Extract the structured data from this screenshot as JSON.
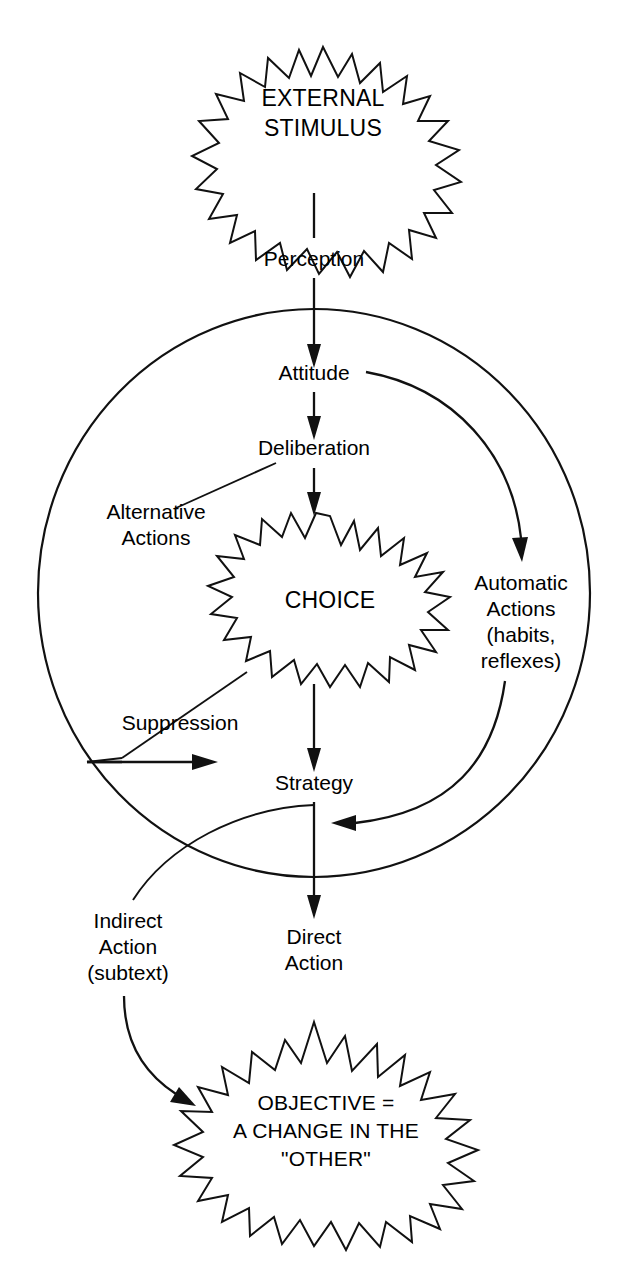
{
  "figure": {
    "kind": "flow-diagram",
    "background_color": "#ffffff",
    "ink_color": "#111111",
    "nodes": {
      "external_stimulus": {
        "shape": "starburst",
        "line1": "EXTERNAL",
        "line2": "STIMULUS"
      },
      "perception": {
        "shape": "text",
        "label": "Perception"
      },
      "attitude": {
        "shape": "text",
        "label": "Attitude"
      },
      "deliberation": {
        "shape": "text",
        "label": "Deliberation"
      },
      "alternative_actions": {
        "shape": "text",
        "line1": "Alternative",
        "line2": "Actions"
      },
      "choice": {
        "shape": "starburst",
        "label": "CHOICE"
      },
      "automatic_actions": {
        "shape": "text",
        "line1": "Automatic",
        "line2": "Actions",
        "line3": "(habits,",
        "line4": "reflexes)"
      },
      "suppression": {
        "shape": "text",
        "label": "Suppression"
      },
      "strategy": {
        "shape": "text",
        "label": "Strategy"
      },
      "indirect_action": {
        "shape": "text",
        "line1": "Indirect",
        "line2": "Action",
        "line3": "(subtext)"
      },
      "direct_action": {
        "shape": "text",
        "line1": "Direct",
        "line2": "Action"
      },
      "objective": {
        "shape": "starburst",
        "line1": "OBJECTIVE =",
        "line2": "A CHANGE IN THE",
        "line3": "\"OTHER\""
      }
    },
    "enclosure": {
      "name": "inner-world-circle",
      "shape": "circle"
    },
    "edges": [
      {
        "from": "external_stimulus",
        "to": "perception",
        "style": "straight"
      },
      {
        "from": "perception",
        "to": "attitude",
        "style": "straight-arrow"
      },
      {
        "from": "attitude",
        "to": "deliberation",
        "style": "straight-arrow"
      },
      {
        "from": "deliberation",
        "to": "choice",
        "style": "straight-arrow"
      },
      {
        "from": "alternative_actions",
        "to": "deliberation",
        "style": "leader-line"
      },
      {
        "from": "attitude",
        "to": "automatic_actions",
        "style": "curved-arrow"
      },
      {
        "from": "suppression",
        "to": "choice",
        "style": "leader-line"
      },
      {
        "from": "suppression",
        "to": "right",
        "style": "horizontal-arrow"
      },
      {
        "from": "choice",
        "to": "strategy",
        "style": "straight-arrow"
      },
      {
        "from": "automatic_actions",
        "to": "strategy",
        "style": "curved-arrow"
      },
      {
        "from": "strategy",
        "to": "direct_action",
        "style": "straight-arrow"
      },
      {
        "from": "strategy",
        "to": "indirect_action",
        "style": "curved-leader"
      },
      {
        "from": "indirect_action",
        "to": "objective",
        "style": "curved-arrow"
      },
      {
        "from": "direct_action",
        "to": "objective",
        "style": "straight-arrow"
      }
    ]
  }
}
